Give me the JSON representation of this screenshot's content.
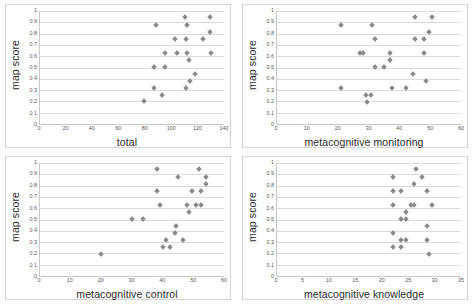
{
  "figure": {
    "panel_count": 4,
    "marker_color": "#8a8a8a",
    "grid_color": "#dcdcdc",
    "axis_color": "#c9c9c9",
    "background": "#ffffff"
  },
  "shared": {
    "ylabel": "map score",
    "yticks": [
      "0",
      "0.1",
      "0.2",
      "0.3",
      "0.4",
      "0.5",
      "0.6",
      "0.7",
      "0.8",
      "0.9",
      "1"
    ],
    "ylim": [
      0,
      1
    ]
  },
  "chart_data": [
    {
      "type": "scatter",
      "title": "",
      "xlabel": "total",
      "ylabel": "map score",
      "xlim": [
        0,
        140
      ],
      "ylim": [
        0,
        1
      ],
      "xticks": [
        "0",
        "20",
        "40",
        "60",
        "80",
        "100",
        "120",
        "140"
      ],
      "yticks": [
        "0",
        "0.1",
        "0.2",
        "0.3",
        "0.4",
        "0.5",
        "0.6",
        "0.7",
        "0.8",
        "0.9",
        "1"
      ],
      "grid": true,
      "legend": "none",
      "x": [
        79,
        87,
        88,
        93,
        95,
        95,
        103,
        104,
        110,
        111,
        111,
        112,
        112,
        112,
        113,
        114,
        118,
        124,
        129,
        129,
        130
      ],
      "y": [
        0.2,
        0.315,
        0.88,
        0.255,
        0.505,
        0.625,
        0.755,
        0.625,
        0.945,
        0.315,
        0.755,
        0.625,
        0.88,
        0.315,
        0.57,
        0.38,
        0.445,
        0.755,
        0.945,
        0.81,
        0.625
      ],
      "points": [
        [
          79,
          0.2
        ],
        [
          87,
          0.315
        ],
        [
          88,
          0.88
        ],
        [
          93,
          0.255
        ],
        [
          95,
          0.505
        ],
        [
          95,
          0.625
        ],
        [
          103,
          0.755
        ],
        [
          104,
          0.625
        ],
        [
          110,
          0.945
        ],
        [
          111,
          0.315
        ],
        [
          111,
          0.755
        ],
        [
          112,
          0.625
        ],
        [
          112,
          0.88
        ],
        [
          113,
          0.57
        ],
        [
          114,
          0.38
        ],
        [
          118,
          0.445
        ],
        [
          124,
          0.755
        ],
        [
          129,
          0.945
        ],
        [
          129,
          0.81
        ],
        [
          130,
          0.625
        ],
        [
          87,
          0.505
        ]
      ]
    },
    {
      "type": "scatter",
      "title": "",
      "xlabel": "metacognitive monitoring",
      "ylabel": "map score",
      "xlim": [
        0,
        60
      ],
      "ylim": [
        0,
        1
      ],
      "xticks": [
        "0",
        "10",
        "20",
        "30",
        "40",
        "50",
        "60"
      ],
      "yticks": [
        "0",
        "0.1",
        "0.2",
        "0.3",
        "0.4",
        "0.5",
        "0.6",
        "0.7",
        "0.8",
        "0.9",
        "1"
      ],
      "grid": true,
      "legend": "none",
      "points": [
        [
          21,
          0.88
        ],
        [
          21,
          0.315
        ],
        [
          27,
          0.625
        ],
        [
          28,
          0.625
        ],
        [
          29,
          0.255
        ],
        [
          29.5,
          0.195
        ],
        [
          30.5,
          0.255
        ],
        [
          31,
          0.88
        ],
        [
          32,
          0.755
        ],
        [
          32,
          0.505
        ],
        [
          35,
          0.505
        ],
        [
          37,
          0.625
        ],
        [
          37,
          0.565
        ],
        [
          37.5,
          0.315
        ],
        [
          42,
          0.315
        ],
        [
          44.5,
          0.445
        ],
        [
          45,
          0.945
        ],
        [
          45,
          0.755
        ],
        [
          48,
          0.755
        ],
        [
          48,
          0.625
        ],
        [
          48.5,
          0.38
        ],
        [
          49.5,
          0.81
        ],
        [
          50.5,
          0.945
        ]
      ]
    },
    {
      "type": "scatter",
      "title": "",
      "xlabel": "metacognitive control",
      "ylabel": "map score",
      "xlim": [
        0,
        60
      ],
      "ylim": [
        0,
        1
      ],
      "xticks": [
        "0",
        "10",
        "20",
        "30",
        "40",
        "50",
        "60"
      ],
      "yticks": [
        "0",
        "0.1",
        "0.2",
        "0.3",
        "0.4",
        "0.5",
        "0.6",
        "0.7",
        "0.8",
        "0.9",
        "1"
      ],
      "grid": true,
      "legend": "none",
      "points": [
        [
          20,
          0.195
        ],
        [
          30,
          0.505
        ],
        [
          33.5,
          0.505
        ],
        [
          38,
          0.945
        ],
        [
          38,
          0.755
        ],
        [
          39,
          0.625
        ],
        [
          40,
          0.255
        ],
        [
          41,
          0.315
        ],
        [
          42.5,
          0.255
        ],
        [
          44,
          0.38
        ],
        [
          44.5,
          0.445
        ],
        [
          45,
          0.88
        ],
        [
          46.5,
          0.315
        ],
        [
          48,
          0.625
        ],
        [
          48.5,
          0.57
        ],
        [
          49.5,
          0.755
        ],
        [
          51,
          0.625
        ],
        [
          52,
          0.945
        ],
        [
          52.5,
          0.625
        ],
        [
          52.5,
          0.755
        ],
        [
          54,
          0.88
        ],
        [
          54,
          0.81
        ]
      ]
    },
    {
      "type": "scatter",
      "title": "",
      "xlabel": "metacognitive knowledge",
      "ylabel": "map score",
      "xlim": [
        0,
        35
      ],
      "ylim": [
        0,
        1
      ],
      "xticks": [
        "0",
        "5",
        "10",
        "15",
        "20",
        "25",
        "30",
        "35"
      ],
      "yticks": [
        "0",
        "0.1",
        "0.2",
        "0.3",
        "0.4",
        "0.5",
        "0.6",
        "0.7",
        "0.8",
        "0.9",
        "1"
      ],
      "grid": true,
      "legend": "none",
      "points": [
        [
          22,
          0.88
        ],
        [
          22,
          0.755
        ],
        [
          22,
          0.625
        ],
        [
          22,
          0.38
        ],
        [
          22,
          0.255
        ],
        [
          23.5,
          0.755
        ],
        [
          23.5,
          0.505
        ],
        [
          23.5,
          0.315
        ],
        [
          23.5,
          0.255
        ],
        [
          24.5,
          0.505
        ],
        [
          24.5,
          0.565
        ],
        [
          24.5,
          0.315
        ],
        [
          25.5,
          0.625
        ],
        [
          26,
          0.625
        ],
        [
          26,
          0.81
        ],
        [
          26.5,
          0.945
        ],
        [
          27.5,
          0.88
        ],
        [
          28.5,
          0.755
        ],
        [
          28.5,
          0.445
        ],
        [
          28.5,
          0.315
        ],
        [
          29,
          0.195
        ],
        [
          29.5,
          0.625
        ]
      ]
    }
  ]
}
